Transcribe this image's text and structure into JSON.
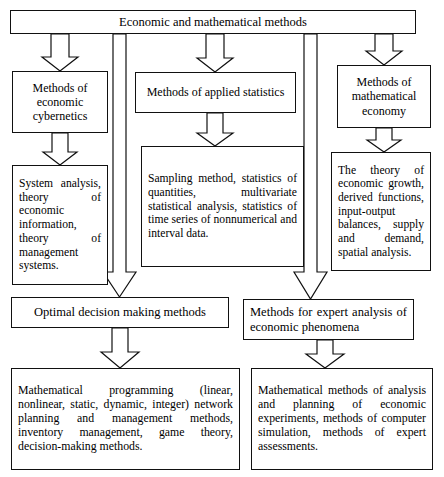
{
  "diagram": {
    "title_box": {
      "label": "Economic and mathematical methods"
    },
    "level2": {
      "cybernetics": "Methods of economic cybernetics",
      "applied_statistics": "Methods of applied statistics",
      "mathematical_economy": "Methods of mathematical economy"
    },
    "level3": {
      "system_analysis": "System analysis, theory of economic information, theory of management systems.",
      "sampling": "Sampling method, statistics of quantities, multivariate statistical analysis, statistics of time series of nonnumerical and interval data.",
      "theory_growth": "The theory of economic growth, derived functions, input-output balances, supply and demand, spatial analysis."
    },
    "level4": {
      "optimal_decision": "Optimal decision making methods",
      "expert_analysis": "Methods for expert analysis of economic phenomena"
    },
    "level5": {
      "mathematical_programming": "Mathematical programming (linear, nonlinear, static, dynamic, integer) network planning and management methods, inventory management, game theory, decision-making methods.",
      "mathematical_methods": "Mathematical methods of analysis and planning of economic experiments, methods of computer simulation, methods of expert assessments."
    },
    "colors": {
      "stroke": "#111111",
      "background": "#ffffff",
      "text": "#000000"
    },
    "arrows": [
      {
        "name": "root-to-cybernetics",
        "from": "title_box",
        "to": "cybernetics"
      },
      {
        "name": "root-to-applied-statistics",
        "from": "title_box",
        "to": "applied_statistics"
      },
      {
        "name": "root-to-mathematical-economy",
        "from": "title_box",
        "to": "mathematical_economy"
      },
      {
        "name": "root-to-optimal-decision",
        "from": "title_box",
        "to": "optimal_decision"
      },
      {
        "name": "root-to-expert-analysis",
        "from": "title_box",
        "to": "expert_analysis"
      },
      {
        "name": "cybernetics-to-system-analysis",
        "from": "cybernetics",
        "to": "system_analysis"
      },
      {
        "name": "applied-statistics-to-sampling",
        "from": "applied_statistics",
        "to": "sampling"
      },
      {
        "name": "mathematical-economy-to-theory-growth",
        "from": "mathematical_economy",
        "to": "theory_growth"
      },
      {
        "name": "optimal-decision-to-mathematical-programming",
        "from": "optimal_decision",
        "to": "mathematical_programming"
      },
      {
        "name": "expert-analysis-to-mathematical-methods",
        "from": "expert_analysis",
        "to": "mathematical_methods"
      }
    ]
  }
}
